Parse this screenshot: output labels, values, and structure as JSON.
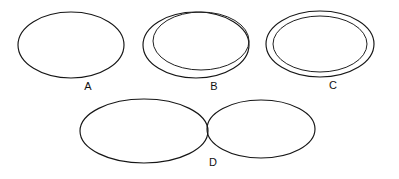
{
  "figure": {
    "background_color": "#ffffff",
    "stroke_color": "#161616",
    "hatch_color": "#3a3a3a",
    "label_color": "#111111",
    "canvas": {
      "width": 399,
      "height": 179
    },
    "hatch": {
      "angle_deg": 45,
      "direction": "lower-left to upper-right",
      "spacing_px": 5.2,
      "line_width_px": 0.85
    },
    "panels": [
      {
        "id": "A",
        "label": "A",
        "label_x": 88,
        "label_y": 90,
        "description": "single ellipse, fully hatched",
        "shapes": [
          {
            "role": "hatched-ellipse",
            "cx": 71,
            "cy": 45,
            "rx": 53,
            "ry": 33,
            "rotation_deg": 0,
            "hatched": true
          }
        ]
      },
      {
        "id": "B",
        "label": "B",
        "label_x": 214,
        "label_y": 90,
        "description": "outer ellipse with offset inner hatched ellipse, internally tangent at lower-left",
        "shapes": [
          {
            "role": "outer-ellipse",
            "cx": 196,
            "cy": 45,
            "rx": 53,
            "ry": 33,
            "rotation_deg": 0,
            "hatched": false
          },
          {
            "role": "inner-hatched-ellipse",
            "cx": 201,
            "cy": 41,
            "rx": 48,
            "ry": 29,
            "rotation_deg": 0,
            "hatched": true
          }
        ]
      },
      {
        "id": "C",
        "label": "C",
        "label_x": 333,
        "label_y": 89,
        "description": "outer ellipse with concentric inner hatched ellipse",
        "shapes": [
          {
            "role": "outer-ellipse",
            "cx": 320,
            "cy": 44,
            "rx": 54,
            "ry": 33,
            "rotation_deg": 0,
            "hatched": false
          },
          {
            "role": "inner-hatched-ellipse",
            "cx": 320,
            "cy": 44,
            "rx": 47,
            "ry": 28,
            "rotation_deg": 0,
            "hatched": true
          }
        ]
      },
      {
        "id": "D",
        "label": "D",
        "label_x": 213,
        "label_y": 166,
        "description": "two externally tangent unhatched ellipses",
        "shapes": [
          {
            "role": "left-ellipse",
            "cx": 144,
            "cy": 131,
            "rx": 64,
            "ry": 32,
            "rotation_deg": 0,
            "hatched": false
          },
          {
            "role": "right-ellipse",
            "cx": 261,
            "cy": 129,
            "rx": 54,
            "ry": 29,
            "rotation_deg": 0,
            "hatched": false
          }
        ]
      }
    ]
  }
}
